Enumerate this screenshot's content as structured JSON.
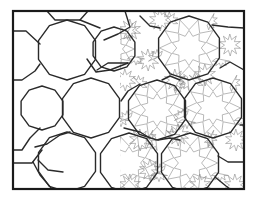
{
  "figure": {
    "frame": {
      "x": 13,
      "y": 11,
      "width": 231,
      "height": 178
    },
    "colors": {
      "tile_outline": "#2a2a2a",
      "strapwork": "#8a8a8a",
      "frame": "#1a1a1a",
      "background": "#ffffff"
    },
    "tiles": {
      "decagons": [
        {
          "cx": 67,
          "cy": 50,
          "r": 30
        },
        {
          "cx": 91,
          "cy": 108,
          "r": 30
        },
        {
          "cx": 42,
          "cy": 108,
          "r": 22
        },
        {
          "cx": 67,
          "cy": 162,
          "r": 30
        },
        {
          "cx": 114,
          "cy": 49,
          "r": 22
        },
        {
          "cx": 129,
          "cy": 163,
          "r": 30
        },
        {
          "cx": 189,
          "cy": 48,
          "r": 32
        },
        {
          "cx": 213,
          "cy": 108,
          "r": 30
        },
        {
          "cx": 157,
          "cy": 110,
          "r": 30
        },
        {
          "cx": 190,
          "cy": 163,
          "r": 30
        }
      ],
      "strapwork_region": {
        "x_start": 120,
        "x_end": 244
      }
    }
  }
}
